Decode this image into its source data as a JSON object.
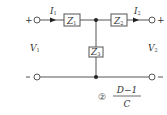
{
  "diagram": {
    "type": "two-port T network",
    "components": {
      "z1": {
        "label": "Z",
        "sub": "1"
      },
      "z2": {
        "label": "Z",
        "sub": "2"
      },
      "z3": {
        "label": "Z",
        "sub": "3"
      }
    },
    "currents": {
      "i1": {
        "label": "I",
        "sub": "1"
      },
      "i2": {
        "label": "I",
        "sub": "2"
      }
    },
    "voltages": {
      "v1": {
        "label": "V",
        "sub": "1"
      },
      "v2": {
        "label": "V",
        "sub": "2"
      }
    },
    "terminals": {
      "plus": "+",
      "minus": "−"
    },
    "answer": {
      "marker": "②",
      "numerator": "D−1",
      "denominator": "C"
    },
    "colors": {
      "line": "#555555",
      "text": "#333333"
    }
  }
}
